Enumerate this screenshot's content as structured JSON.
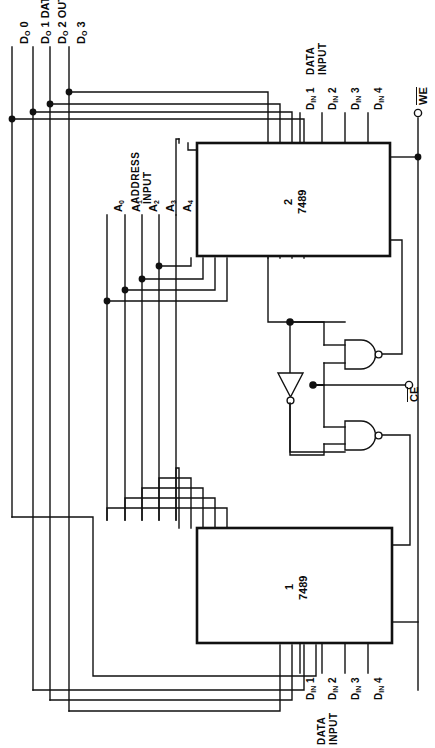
{
  "diagram": {
    "line_color": "#111111",
    "background": "#ffffff",
    "chips": [
      {
        "id": "chip2",
        "number": "2",
        "type": "7489"
      },
      {
        "id": "chip1",
        "number": "1",
        "type": "7489"
      }
    ],
    "labels": {
      "data_output_group": "DATA OUTPUT",
      "data_output_pins": [
        "D",
        "D",
        "D",
        "D"
      ],
      "data_output_lines": [
        "D₀ 0",
        "D₀ 1 DATA",
        "D₀ 2 OUTPUT",
        "D₀ 3"
      ],
      "data_output_0": "D",
      "address_input_group": "ADDRESS\nINPUT",
      "address_input_line1": "ADDRESS",
      "address_input_line2": "INPUT",
      "address_pins": [
        "A",
        "A",
        "A",
        "A",
        "A"
      ],
      "address_subs": [
        "0",
        "1",
        "2",
        "3",
        "4"
      ],
      "data_input_group_top_line1": "DATA",
      "data_input_group_top_line2": "INPUT",
      "data_input_group_bottom_line1": "DATA",
      "data_input_group_bottom_line2": "INPUT",
      "data_in_top": [
        "D",
        "D",
        "D",
        "D"
      ],
      "data_in_top_nums": [
        "1",
        "2",
        "3",
        "4"
      ],
      "data_in_bottom": [
        "D",
        "D",
        "D",
        "D"
      ],
      "data_in_bottom_nums": [
        "1",
        "2",
        "3",
        "4"
      ],
      "din_sub": "IN",
      "write_enable": "WE",
      "chip_enable": "CE",
      "do_sub": "O"
    },
    "gates": [
      {
        "id": "nand-upper",
        "type": "nand",
        "inputs": 2
      },
      {
        "id": "nand-lower",
        "type": "nand",
        "inputs": 2
      },
      {
        "id": "inverter",
        "type": "inverter",
        "inputs": 1
      }
    ],
    "terminals": [
      {
        "name": "WE",
        "shape": "open-circle"
      },
      {
        "name": "CE",
        "shape": "open-circle"
      }
    ]
  }
}
